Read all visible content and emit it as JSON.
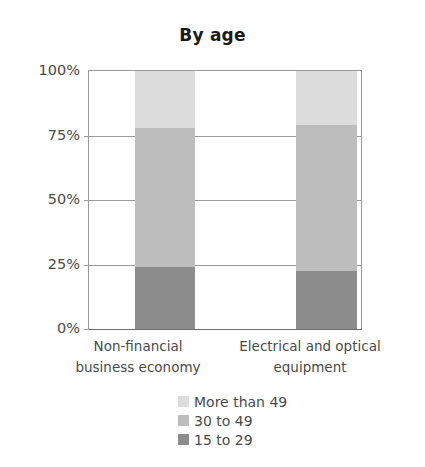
{
  "chart_data": {
    "type": "bar",
    "subtype": "stacked-percentage",
    "title": "By age",
    "xlabel": "",
    "ylabel": "",
    "ylim": [
      0,
      100
    ],
    "ytick_labels": [
      "0%",
      "25%",
      "50%",
      "75%",
      "100%"
    ],
    "ytick_values": [
      0,
      25,
      50,
      75,
      100
    ],
    "grid": true,
    "grid_axis": "y",
    "legend_position": "bottom",
    "categories": [
      "Non-financial business economy",
      "Electrical and optical equipment"
    ],
    "category_lines": [
      [
        "Non-financial",
        "business economy"
      ],
      [
        "Electrical and optical",
        "equipment"
      ]
    ],
    "series": [
      {
        "name": "15 to 29",
        "color": "#8c8c8c",
        "values": [
          24,
          22.5
        ]
      },
      {
        "name": "30 to 49",
        "color": "#bdbdbd",
        "values": [
          54,
          56.5
        ]
      },
      {
        "name": "More than 49",
        "color": "#dcdcdc",
        "values": [
          22,
          21
        ]
      }
    ],
    "legend_order": [
      "More than 49",
      "30 to 49",
      "15 to 29"
    ]
  },
  "colors": {
    "light_gray": "#dcdcdc",
    "medium_gray": "#bdbdbd",
    "dark_gray": "#8c8c8c",
    "axis": "#9a9a9a",
    "text": "#4a4a4a",
    "title_text": "#1a1a1a",
    "background": "#ffffff"
  }
}
